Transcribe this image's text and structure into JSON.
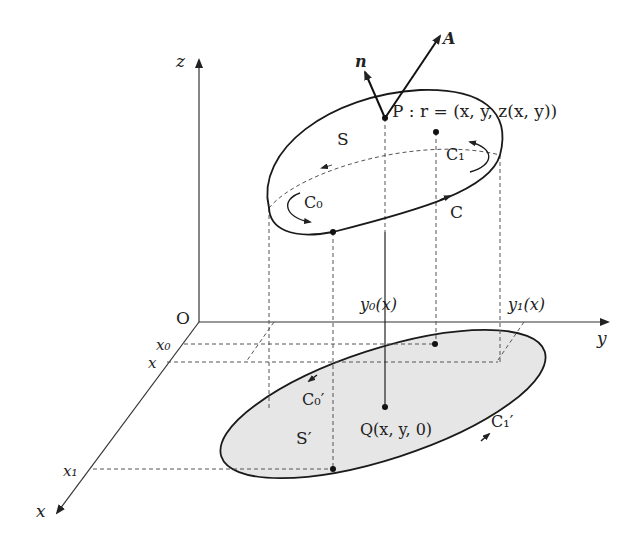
{
  "diagram": {
    "axes": {
      "origin_label": "O",
      "x_label": "x",
      "y_label": "y",
      "z_label": "z"
    },
    "x_ticks": [
      "x₀",
      "x",
      "x₁"
    ],
    "y_ticks": [
      "y₀(x)",
      "y₁(x)"
    ],
    "surface": {
      "label": "S",
      "curve_label": "C",
      "sub_curves": [
        "C₀",
        "C₁"
      ],
      "point_label": "P : r = (x, y, z(x, y))",
      "vectors": [
        "n",
        "A"
      ]
    },
    "projection": {
      "label": "S′",
      "sub_curves": [
        "C₀′",
        "C₁′"
      ],
      "point_label": "Q(x, y, 0)",
      "fill_color": "#e6e6e6"
    }
  }
}
